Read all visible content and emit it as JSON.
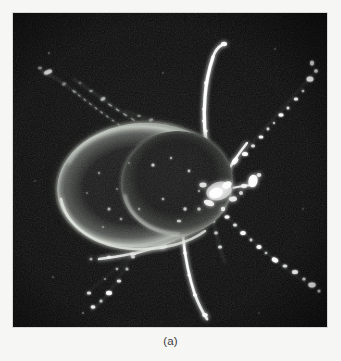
{
  "figure": {
    "caption": "(a)",
    "subject_label": "tick-darkfield-micrograph",
    "panel_background_color": "#050506",
    "page_background_color": "#f6f6f4",
    "caption_color": "#3a3a3a",
    "highlight_color": "#ffffff",
    "body_rim_color": "#c9cdc8",
    "panel": {
      "x": 13,
      "y": 13,
      "width": 314,
      "height": 314
    }
  },
  "specimen": {
    "name": "tick",
    "view": "dorsal",
    "idiosoma": {
      "center_x": 128,
      "center_y": 172,
      "radius_x": 84,
      "radius_y": 62,
      "rotation_deg": -6
    },
    "scutum": {
      "center_x": 162,
      "center_y": 170,
      "radius_x": 56,
      "radius_y": 52,
      "rotation_deg": -4
    },
    "capitulum": {
      "center_x": 205,
      "center_y": 168
    },
    "leg_count": 8
  }
}
